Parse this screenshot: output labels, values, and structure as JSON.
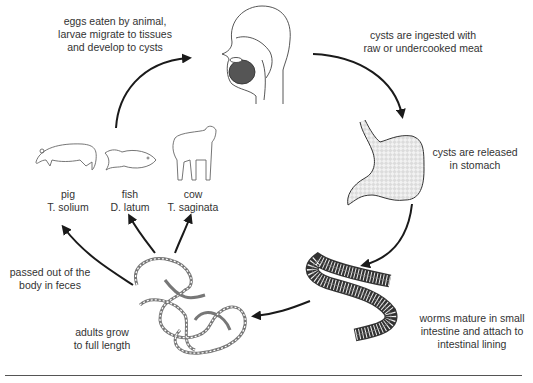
{
  "diagram": {
    "stages": {
      "eggs_eaten": {
        "lines": [
          "eggs eaten by animal,",
          "larvae migrate to tissues",
          "and develop to cysts"
        ]
      },
      "ingested": {
        "lines": [
          "cysts are ingested with",
          "raw or undercooked meat"
        ]
      },
      "stomach": {
        "lines": [
          "cysts are released",
          "in stomach"
        ]
      },
      "intestine": {
        "lines": [
          "worms mature in small",
          "intestine and attach to",
          "intestinal lining"
        ]
      },
      "adults": {
        "lines": [
          "adults grow",
          "to full length"
        ]
      },
      "passed": {
        "lines": [
          "passed out of the",
          "body in feces"
        ]
      }
    },
    "hosts": [
      {
        "animal": "pig",
        "species": "T. solium",
        "icon": "pig-icon"
      },
      {
        "animal": "fish",
        "species": "D. latum",
        "icon": "fish-icon"
      },
      {
        "animal": "cow",
        "species": "T. saginata",
        "icon": "cow-icon"
      }
    ],
    "icons": {
      "head": "human-head-icon",
      "stomach": "stomach-icon",
      "intestine": "intestine-icon",
      "worms": "tapeworm-icon"
    },
    "colors": {
      "line": "#222222",
      "text": "#333333",
      "stomach_fill": "#e6e6e6"
    }
  }
}
